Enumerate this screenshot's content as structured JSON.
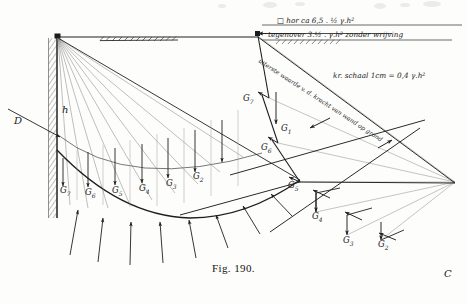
{
  "figure": {
    "caption": "Fig. 190.",
    "corner_mark": "C"
  },
  "annotations": {
    "top_line1": "□ hor ca 6,5 . ½ γ.h²",
    "top_line2": "tegenover 3.½ . γ.h² zonder wrijving",
    "diagonal": "uiterste waarde v. d. kracht van wand op grond",
    "scale": "kr. schaal 1cm = 0,4 γ.h²",
    "wall_height": "h",
    "depth": "D"
  },
  "slice_weights_ground": [
    {
      "id": "G7",
      "base": "G",
      "sub": "7",
      "x": 60,
      "y": 189
    },
    {
      "id": "G6",
      "base": "G",
      "sub": "6",
      "x": 85,
      "y": 190
    },
    {
      "id": "G5",
      "base": "G",
      "sub": "5",
      "x": 112,
      "y": 188
    },
    {
      "id": "G4",
      "base": "G",
      "sub": "4",
      "x": 139,
      "y": 186
    },
    {
      "id": "G3",
      "base": "G",
      "sub": "3",
      "x": 165,
      "y": 181
    },
    {
      "id": "G2",
      "base": "G",
      "sub": "2",
      "x": 192,
      "y": 175
    }
  ],
  "force_polygon_labels": [
    {
      "id": "G7",
      "base": "G",
      "sub": "7",
      "x": 243,
      "y": 101
    },
    {
      "id": "G1",
      "base": "G",
      "sub": "1",
      "x": 282,
      "y": 127
    },
    {
      "id": "G6",
      "base": "G",
      "sub": "6",
      "x": 263,
      "y": 147
    },
    {
      "id": "G5",
      "base": "G",
      "sub": "5",
      "x": 289,
      "y": 185
    },
    {
      "id": "G4",
      "base": "G",
      "sub": "4",
      "x": 314,
      "y": 215
    },
    {
      "id": "G3",
      "base": "G",
      "sub": "3",
      "x": 345,
      "y": 239
    },
    {
      "id": "G2",
      "base": "G",
      "sub": "2",
      "x": 380,
      "y": 243
    }
  ],
  "colors": {
    "ink": "#202020",
    "ink_light": "#6b6b6b",
    "paper": "#fdfdfc"
  }
}
